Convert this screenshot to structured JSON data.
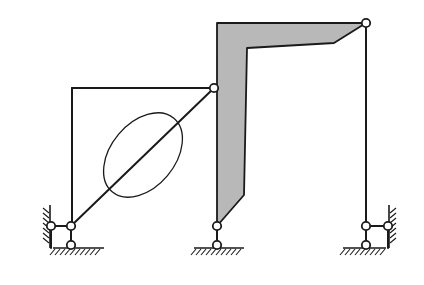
{
  "diagram": {
    "type": "planar-linkage-mechanism",
    "colors": {
      "stroke": "#1a1a1a",
      "body_fill": "#b8b8b8",
      "joint_fill": "#ffffff",
      "background": "#ffffff"
    },
    "joints": [
      {
        "id": "left-wall-slider-joint",
        "x": 51,
        "y": 226
      },
      {
        "id": "left-main-joint",
        "x": 71,
        "y": 226
      },
      {
        "id": "left-ground-joint",
        "x": 71,
        "y": 245
      },
      {
        "id": "diagonal-top-joint",
        "x": 214,
        "y": 88
      },
      {
        "id": "middle-upper-joint",
        "x": 217,
        "y": 226
      },
      {
        "id": "middle-ground-joint",
        "x": 217,
        "y": 245
      },
      {
        "id": "right-top-joint",
        "x": 366,
        "y": 23
      },
      {
        "id": "right-main-joint",
        "x": 366,
        "y": 226
      },
      {
        "id": "right-wall-slider-joint",
        "x": 388,
        "y": 226
      },
      {
        "id": "right-ground-joint",
        "x": 366,
        "y": 245
      }
    ],
    "links": [
      {
        "id": "left-vertical-link",
        "from": [
          72,
          226
        ],
        "to": [
          72,
          88
        ]
      },
      {
        "id": "top-horizontal-link",
        "from": [
          72,
          88
        ],
        "to": [
          214,
          88
        ]
      },
      {
        "id": "diagonal-link",
        "from": [
          71,
          226
        ],
        "to": [
          214,
          88
        ]
      },
      {
        "id": "right-vertical-link",
        "from": [
          366,
          23
        ],
        "to": [
          366,
          226
        ]
      }
    ],
    "ellipse": {
      "cx": 143,
      "cy": 155,
      "rx": 32,
      "ry": 48,
      "rotate": 40
    },
    "l_body_points": "217,23 366,23 334,43 247,48 244,195 217,226",
    "grounds": [
      {
        "id": "left-ground",
        "x1": 53,
        "x2": 104,
        "y": 248
      },
      {
        "id": "middle-ground",
        "x1": 194,
        "x2": 244,
        "y": 248
      },
      {
        "id": "right-ground",
        "x1": 343,
        "x2": 386,
        "y": 248
      }
    ],
    "walls": [
      {
        "id": "left-wall",
        "x": 50,
        "y1": 205,
        "y2": 248,
        "side": "left"
      },
      {
        "id": "right-wall",
        "x": 389,
        "y1": 205,
        "y2": 248,
        "side": "right"
      }
    ]
  }
}
